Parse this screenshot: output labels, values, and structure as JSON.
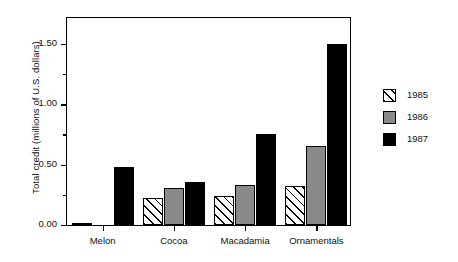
{
  "chart_data": {
    "type": "bar",
    "title": "",
    "subtitle": "",
    "xlabel": "",
    "ylabel": "Total credit (millions of U.S. dollars)",
    "categories": [
      "Melon",
      "Cocoa",
      "Macadamia",
      "Ornamentals"
    ],
    "series": [
      {
        "name": "1985",
        "values": [
          0.01,
          0.22,
          0.24,
          0.32
        ]
      },
      {
        "name": "1986",
        "values": [
          0.0,
          0.31,
          0.33,
          0.65
        ]
      },
      {
        "name": "1987",
        "values": [
          0.48,
          0.36,
          0.75,
          1.5
        ]
      }
    ],
    "ylim": [
      0.0,
      1.73
    ],
    "ytick_labels": [
      "0.00",
      "0.50",
      "1.00",
      "1.50"
    ],
    "ytick_values": [
      0.0,
      0.5,
      1.0,
      1.5
    ],
    "yminor_values": [
      0.25,
      0.75,
      1.25,
      1.75
    ],
    "grid": false,
    "legend_position": "right",
    "legend_entries": [
      "1985",
      "1986",
      "1987"
    ],
    "colors": {
      "series_1985": "#ffffff",
      "series_1985_hatch": "#000000",
      "series_1986": "#8a8a8a",
      "series_1987": "#000000",
      "axis": "#000000",
      "background": "#ffffff"
    }
  }
}
